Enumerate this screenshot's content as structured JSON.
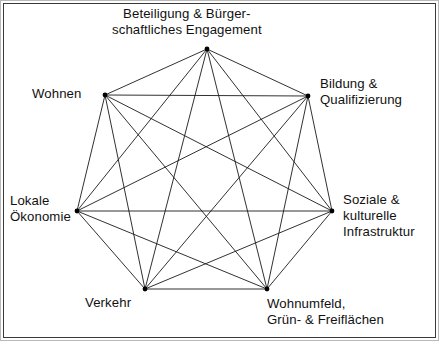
{
  "diagram": {
    "type": "complete-graph",
    "title": "",
    "node_count": 7,
    "edge_count": 21,
    "edge_color": "#1a1a1a",
    "node_color": "#000000",
    "background_color": "#ffffff",
    "border_color": "#3a3a3a",
    "nodes": [
      {
        "id": "beteiligung",
        "lines": [
          "Beteiligung & Bürger-",
          "schaftliches Engagement"
        ],
        "x": 207,
        "y": 49
      },
      {
        "id": "wohnen",
        "lines": [
          "Wohnen"
        ],
        "x": 105,
        "y": 95
      },
      {
        "id": "bildung",
        "lines": [
          "Bildung &",
          "Qualifizierung"
        ],
        "x": 308,
        "y": 96
      },
      {
        "id": "lokale-oekonomie",
        "lines": [
          "Lokale",
          "Ökonomie"
        ],
        "x": 77,
        "y": 211
      },
      {
        "id": "soziale-infrastruktur",
        "lines": [
          "Soziale &",
          "kulturelle",
          "Infrastruktur"
        ],
        "x": 332,
        "y": 211
      },
      {
        "id": "verkehr",
        "lines": [
          "Verkehr"
        ],
        "x": 145,
        "y": 289
      },
      {
        "id": "wohnumfeld",
        "lines": [
          "Wohnumfeld,",
          "Grün- & Freiflächen"
        ],
        "x": 267,
        "y": 289
      }
    ]
  },
  "labels": {
    "beteiligung_line1": "Beteiligung & Bürger-",
    "beteiligung_line2": "schaftliches Engagement",
    "wohnen_line1": "Wohnen",
    "bildung_line1": "Bildung &",
    "bildung_line2": "Qualifizierung",
    "lokale_line1": "Lokale",
    "lokale_line2": "Ökonomie",
    "soziale_line1": "Soziale &",
    "soziale_line2": "kulturelle",
    "soziale_line3": "Infrastruktur",
    "verkehr_line1": "Verkehr",
    "wohnumfeld_line1": "Wohnumfeld,",
    "wohnumfeld_line2": "Grün- & Freiflächen"
  }
}
